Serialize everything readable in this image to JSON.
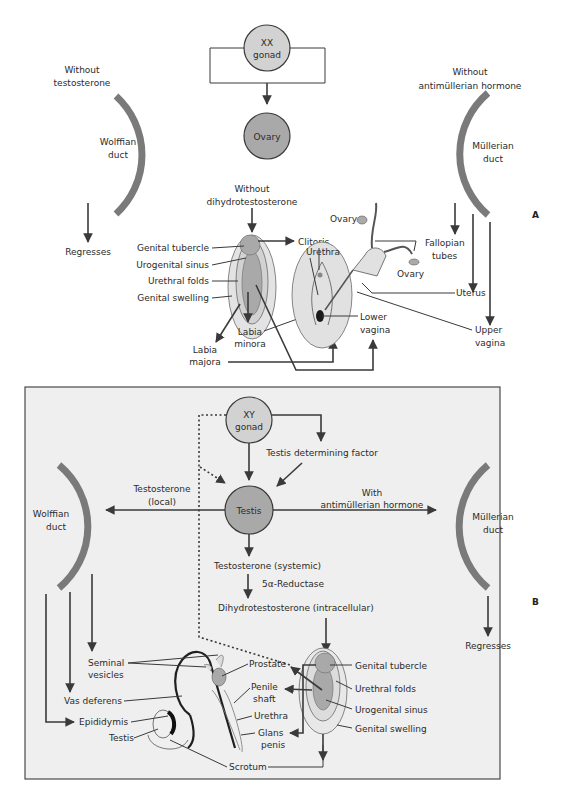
{
  "panel_a": {
    "letter": "A",
    "gonad": "XX",
    "gonad_sub": "gonad",
    "ovary_node": "Ovary",
    "wolffian_cond_1": "Without",
    "wolffian_cond_2": "testosterone",
    "wolffian_duct_1": "Wolffian",
    "wolffian_duct_2": "duct",
    "wolffian_fate": "Regresses",
    "mullerian_cond_1": "Without",
    "mullerian_cond_2": "antimüllerian hormone",
    "mullerian_duct_1": "Müllerian",
    "mullerian_duct_2": "duct",
    "dht_cond_1": "Without",
    "dht_cond_2": "dihydrotestosterone",
    "primordia": {
      "genital_tubercle": "Genital tubercle",
      "urogenital_sinus": "Urogenital sinus",
      "urethral_folds": "Urethral folds",
      "genital_swelling": "Genital swelling"
    },
    "structures": {
      "clitoris": "Clitoris",
      "urethra": "Urethra",
      "labia_minora_1": "Labia",
      "labia_minora_2": "minora",
      "labia_majora_1": "Labia",
      "labia_majora_2": "majora",
      "lower_vagina_1": "Lower",
      "lower_vagina_2": "vagina",
      "ovary_top": "Ovary",
      "ovary_bottom": "Ovary",
      "fallopian_1": "Fallopian",
      "fallopian_2": "tubes",
      "uterus": "Uterus",
      "upper_vagina_1": "Upper",
      "upper_vagina_2": "vagina"
    }
  },
  "panel_b": {
    "letter": "B",
    "gonad": "XY",
    "gonad_sub": "gonad",
    "tdf": "Testis determining factor",
    "testis_node": "Testis",
    "testosterone_local_1": "Testosterone",
    "testosterone_local_2": "(local)",
    "amh_1": "With",
    "amh_2": "antimüllerian hormone",
    "wolffian_duct_1": "Wolffian",
    "wolffian_duct_2": "duct",
    "mullerian_duct_1": "Müllerian",
    "mullerian_duct_2": "duct",
    "mullerian_fate": "Regresses",
    "testosterone_systemic": "Testosterone (systemic)",
    "reductase": "5α-Reductase",
    "dht_intracellular": "Dihydrotestosterone (intracellular)",
    "primordia": {
      "genital_tubercle": "Genital tubercle",
      "urethral_folds": "Urethral folds",
      "urogenital_sinus": "Urogenital sinus",
      "genital_swelling": "Genital swelling"
    },
    "structures": {
      "seminal_1": "Seminal",
      "seminal_2": "vesicles",
      "vas_deferens": "Vas deferens",
      "epididymis": "Epididymis",
      "testis": "Testis",
      "prostate": "Prostate",
      "penile_shaft_1": "Penile",
      "penile_shaft_2": "shaft",
      "urethra": "Urethra",
      "glans_1": "Glans",
      "glans_2": "penis",
      "scrotum": "Scrotum"
    }
  },
  "colors": {
    "node_light": "#d2d2d2",
    "node_dark": "#a9a9a9",
    "duct": "#7a7a7a",
    "panel_b_bg": "#efefef",
    "line": "#3a3a3a"
  }
}
